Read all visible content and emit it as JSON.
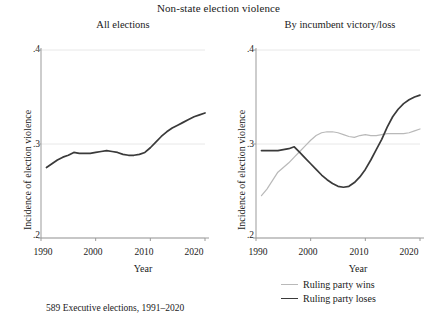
{
  "figure": {
    "title": "Non-state election violence",
    "footnote": "589 Executive elections, 1991–2020",
    "colors": {
      "line_dark": "#3a3a3a",
      "line_light": "#b9b9b9",
      "axis": "#9b9b9b",
      "grid": "#e8e8e8",
      "text": "#1a1a1a",
      "background": "#ffffff"
    }
  },
  "legend": {
    "position": "bottom-right",
    "entries": [
      {
        "label": "Ruling party wins",
        "color": "#b9b9b9"
      },
      {
        "label": "Ruling party loses",
        "color": "#3a3a3a"
      }
    ]
  },
  "axes": {
    "xlabel": "Year",
    "ylabel": "Incidence of election violence",
    "xticks": [
      "1990",
      "2000",
      "2010",
      "2020"
    ],
    "yticks": [
      ".4",
      ".3",
      ".2"
    ],
    "xlim": [
      1990,
      2020
    ],
    "ylim": [
      0.2,
      0.4
    ]
  },
  "chart_data": [
    {
      "type": "line",
      "panel": "left",
      "title": "All elections",
      "xlabel": "Year",
      "ylabel": "Incidence of election violence",
      "xlim": [
        1990,
        2020
      ],
      "ylim": [
        0.2,
        0.4
      ],
      "xticks": [
        1990,
        2000,
        2010,
        2020
      ],
      "yticks": [
        0.2,
        0.3,
        0.4
      ],
      "grid": "horizontal-light",
      "legend": "none",
      "series": [
        {
          "name": "All elections",
          "color": "#3a3a3a",
          "x": [
            1991,
            1992,
            1993,
            1994,
            1995,
            1996,
            1997,
            1998,
            1999,
            2000,
            2001,
            2002,
            2003,
            2004,
            2005,
            2006,
            2007,
            2008,
            2009,
            2010,
            2011,
            2012,
            2013,
            2014,
            2015,
            2016,
            2017,
            2018,
            2019,
            2020
          ],
          "y": [
            0.275,
            0.279,
            0.283,
            0.286,
            0.288,
            0.291,
            0.29,
            0.29,
            0.29,
            0.291,
            0.292,
            0.293,
            0.292,
            0.291,
            0.289,
            0.288,
            0.288,
            0.289,
            0.291,
            0.296,
            0.302,
            0.308,
            0.313,
            0.317,
            0.32,
            0.323,
            0.326,
            0.329,
            0.331,
            0.333
          ]
        }
      ]
    },
    {
      "type": "line",
      "panel": "right",
      "title": "By incumbent victory/loss",
      "xlabel": "Year",
      "ylabel": "Incidence of election violence",
      "xlim": [
        1990,
        2020
      ],
      "ylim": [
        0.2,
        0.4
      ],
      "xticks": [
        1990,
        2000,
        2010,
        2020
      ],
      "yticks": [
        0.2,
        0.3,
        0.4
      ],
      "grid": "horizontal-light",
      "legend": "bottom",
      "series": [
        {
          "name": "Ruling party wins",
          "color": "#b9b9b9",
          "x": [
            1991,
            1992,
            1993,
            1994,
            1995,
            1996,
            1997,
            1998,
            1999,
            2000,
            2001,
            2002,
            2003,
            2004,
            2005,
            2006,
            2007,
            2008,
            2009,
            2010,
            2011,
            2012,
            2013,
            2014,
            2015,
            2016,
            2017,
            2018,
            2019,
            2020
          ],
          "y": [
            0.245,
            0.252,
            0.261,
            0.27,
            0.275,
            0.28,
            0.286,
            0.292,
            0.298,
            0.304,
            0.309,
            0.312,
            0.313,
            0.313,
            0.312,
            0.31,
            0.308,
            0.307,
            0.309,
            0.31,
            0.309,
            0.309,
            0.31,
            0.311,
            0.311,
            0.311,
            0.311,
            0.312,
            0.314,
            0.316
          ]
        },
        {
          "name": "Ruling party loses",
          "color": "#3a3a3a",
          "x": [
            1991,
            1992,
            1993,
            1994,
            1995,
            1996,
            1997,
            1998,
            1999,
            2000,
            2001,
            2002,
            2003,
            2004,
            2005,
            2006,
            2007,
            2008,
            2009,
            2010,
            2011,
            2012,
            2013,
            2014,
            2015,
            2016,
            2017,
            2018,
            2019,
            2020
          ],
          "y": [
            0.293,
            0.293,
            0.293,
            0.293,
            0.294,
            0.295,
            0.297,
            0.291,
            0.285,
            0.279,
            0.273,
            0.267,
            0.262,
            0.258,
            0.255,
            0.254,
            0.255,
            0.259,
            0.265,
            0.273,
            0.283,
            0.294,
            0.305,
            0.318,
            0.329,
            0.337,
            0.343,
            0.347,
            0.35,
            0.352
          ]
        }
      ]
    }
  ]
}
